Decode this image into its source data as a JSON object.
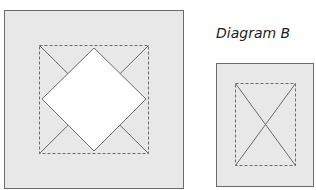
{
  "diagrams": [
    {
      "id": "A",
      "label": "",
      "fill": "#e8e8e8",
      "outer_box": {
        "x": 4,
        "y": 10,
        "w": 179,
        "h": 178
      },
      "inner_dashed_box": {
        "x": 39,
        "y": 45,
        "w": 109,
        "h": 108
      },
      "diamond": {
        "points": "94,48 146,99 94,151 42,99",
        "fill": "#ffffff"
      }
    },
    {
      "id": "B",
      "label": "Diagram B",
      "fill": "#e8e8e8",
      "outer_box": {
        "x": 216,
        "y": 63,
        "w": 97,
        "h": 123
      },
      "inner_dashed_box": {
        "x": 235,
        "y": 83,
        "w": 60,
        "h": 82
      }
    }
  ],
  "colors": {
    "stroke": "#6b6b6b",
    "background": "#ffffff"
  }
}
